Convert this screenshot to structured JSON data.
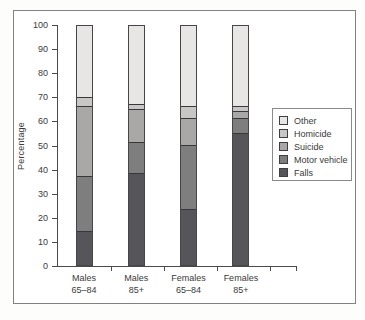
{
  "figure": {
    "ylabel": "Percentage",
    "frame_color": "#828282",
    "axis_color": "#4a4a4a",
    "text_color": "#3a3a3a"
  },
  "legend": {
    "position": "right",
    "items": [
      {
        "label": "Other",
        "color": "#e7e6e4"
      },
      {
        "label": "Homicide",
        "color": "#c8c7c5"
      },
      {
        "label": "Suicide",
        "color": "#a9a8a6"
      },
      {
        "label": "Motor vehicle",
        "color": "#7f7e7e"
      },
      {
        "label": "Falls",
        "color": "#56555a"
      }
    ]
  },
  "chart_data": {
    "type": "bar",
    "stacked": true,
    "title": "",
    "xlabel": "",
    "ylabel": "Percentage",
    "ylim": [
      0,
      100
    ],
    "y_ticks": [
      0,
      10,
      20,
      30,
      40,
      50,
      60,
      70,
      80,
      90,
      100
    ],
    "grid": false,
    "legend_position": "right",
    "categories": [
      "Males 65–84",
      "Males 85+",
      "Females 65–84",
      "Females 85+"
    ],
    "categories_lines": [
      [
        "Males",
        "65–84"
      ],
      [
        "Males",
        "85+"
      ],
      [
        "Females",
        "65–84"
      ],
      [
        "Females",
        "85+"
      ]
    ],
    "series": [
      {
        "name": "Falls",
        "color": "#56555a",
        "values": [
          14,
          38,
          23,
          55
        ]
      },
      {
        "name": "Motor vehicle",
        "color": "#7f7e7e",
        "values": [
          23,
          13,
          27,
          6
        ]
      },
      {
        "name": "Suicide",
        "color": "#a9a8a6",
        "values": [
          29,
          14,
          11,
          3
        ]
      },
      {
        "name": "Homicide",
        "color": "#c8c7c5",
        "values": [
          4,
          2,
          5,
          2
        ]
      },
      {
        "name": "Other",
        "color": "#e7e6e4",
        "values": [
          30,
          33,
          34,
          34
        ]
      }
    ],
    "legend_order": [
      "Other",
      "Homicide",
      "Suicide",
      "Motor vehicle",
      "Falls"
    ]
  }
}
